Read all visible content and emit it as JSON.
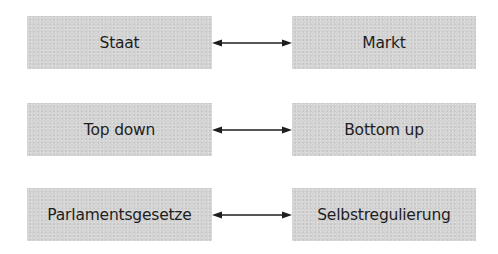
{
  "diagram": {
    "rows": [
      {
        "left": "Staat",
        "right": "Markt",
        "connector": "bidirectional-arrow"
      },
      {
        "left": "Top down",
        "right": "Bottom up",
        "connector": "bidirectional-arrow"
      },
      {
        "left": "Parlamentsgesetze",
        "right": "Selbstregulierung",
        "connector": "bidirectional-arrow"
      }
    ],
    "colors": {
      "box_fill": "#d4d4d4",
      "text": "#1e1e1e",
      "arrow": "#1e1e1e",
      "background": "#ffffff"
    }
  }
}
